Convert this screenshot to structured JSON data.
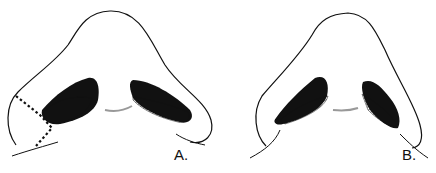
{
  "figure": {
    "panels": [
      {
        "id": "A",
        "label": "A.",
        "description": "Nasal base view with dotted excision lines on left alar base"
      },
      {
        "id": "B",
        "label": "B.",
        "description": "Nasal base view after alar base reduction"
      }
    ],
    "colors": {
      "line": "#111111",
      "background": "#ffffff",
      "nostril_fill": "#111111"
    }
  }
}
